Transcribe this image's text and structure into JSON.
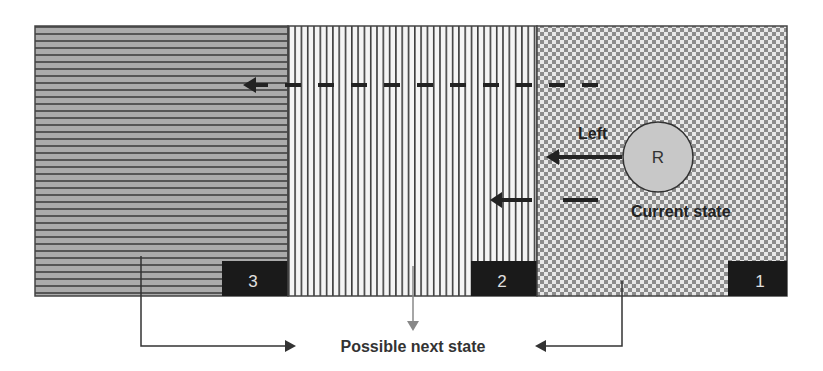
{
  "regions": [
    {
      "id": "3",
      "label": "3",
      "pattern": "horizontal-stripes"
    },
    {
      "id": "2",
      "label": "2",
      "pattern": "vertical-stripes"
    },
    {
      "id": "1",
      "label": "1",
      "pattern": "checkerboard"
    }
  ],
  "robot": {
    "label": "R",
    "caption": "Current state"
  },
  "action": {
    "label": "Left"
  },
  "next_state": {
    "label": "Possible next state"
  },
  "colors": {
    "region3_fill": "#a9a9a9",
    "region3_stripe": "#555555",
    "region2_fill": "#f2f2f2",
    "region2_stripe": "#444444",
    "region1_light": "#e6e6e6",
    "region1_dark": "#8a8a8a",
    "label_box": "#1a1a1a",
    "robot_fill": "#c8c8c8",
    "arrow": "#222222",
    "center_arrow": "#888888"
  }
}
